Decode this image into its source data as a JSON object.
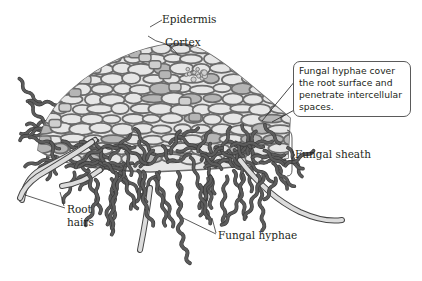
{
  "figure": {
    "labels": {
      "epidermis": "Epidermis",
      "cortex": "Cortex",
      "fungal_sheath": "Fungal sheath",
      "root_hairs_line1": "Root",
      "root_hairs_line2": "hairs",
      "fungal_hyphae": "Fungal hyphae"
    },
    "callout": {
      "lines": [
        "Fungal hyphae cover",
        "the root surface and",
        "penetrate intercellular",
        "spaces."
      ]
    }
  },
  "colors": {
    "background": "#ffffff",
    "cell_fill": "#e6e6e6",
    "cell_wall": "#6b6b6b",
    "dark_cell": "#b5b5b5",
    "hyphae": "#5c5c5c",
    "hyphae_outline": "#3a3a3a",
    "root_hair_fill": "#dcdcdc",
    "leader_line": "#333333",
    "text": "#231f20"
  }
}
